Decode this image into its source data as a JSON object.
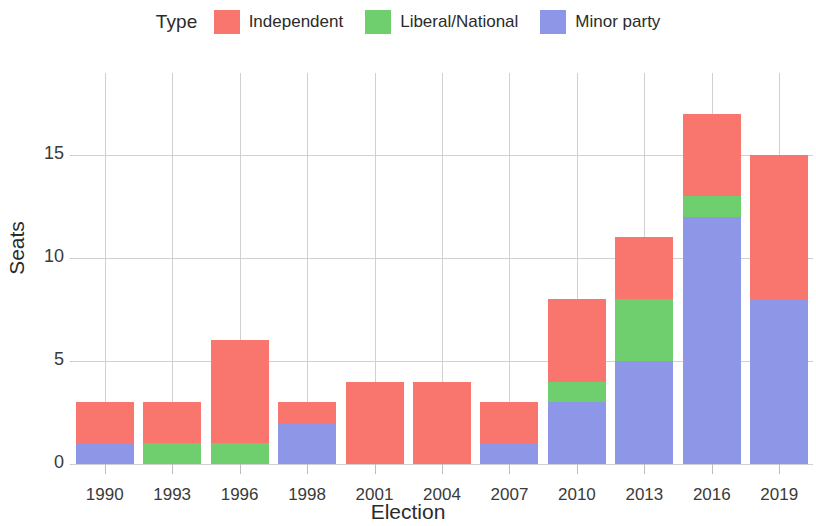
{
  "legend": {
    "title": "Type",
    "entries": [
      {
        "label": "Independent",
        "color": "#F8766D",
        "key": "independent"
      },
      {
        "label": "Liberal/National",
        "color": "#6FCF6F",
        "key": "liberal_national"
      },
      {
        "label": "Minor party",
        "color": "#8E96E8",
        "key": "minor_party"
      }
    ]
  },
  "axes": {
    "y_title": "Seats",
    "x_title": "Election",
    "y_ticks": [
      "0",
      "5",
      "10",
      "15"
    ],
    "x_ticks": [
      "1990",
      "1993",
      "1996",
      "1998",
      "2001",
      "2004",
      "2007",
      "2010",
      "2013",
      "2016",
      "2019"
    ]
  },
  "chart_data": {
    "type": "bar",
    "title": "",
    "subtitle": "",
    "xlabel": "Election",
    "ylabel": "Seats",
    "stacked": true,
    "grid": true,
    "legend_title": "Type",
    "legend_position": "top",
    "ylim": [
      0,
      17.8
    ],
    "yticks": [
      0,
      5,
      10,
      15
    ],
    "categories": [
      "1990",
      "1993",
      "1996",
      "1998",
      "2001",
      "2004",
      "2007",
      "2010",
      "2013",
      "2016",
      "2019"
    ],
    "series": [
      {
        "name": "Minor party",
        "color": "#8E96E8",
        "values": [
          1,
          0,
          0,
          2,
          0,
          0,
          1,
          3,
          5,
          12,
          8
        ]
      },
      {
        "name": "Liberal/National",
        "color": "#6FCF6F",
        "values": [
          0,
          1,
          1,
          0,
          0,
          0,
          0,
          1,
          3,
          1,
          0
        ]
      },
      {
        "name": "Independent",
        "color": "#F8766D",
        "values": [
          2,
          2,
          5,
          1,
          4,
          4,
          2,
          4,
          3,
          4,
          7
        ]
      }
    ],
    "totals": [
      3,
      3,
      6,
      3,
      4,
      4,
      3,
      8,
      11,
      17,
      15
    ],
    "stack_order_bottom_to_top": [
      "Minor party",
      "Liberal/National",
      "Independent"
    ]
  }
}
